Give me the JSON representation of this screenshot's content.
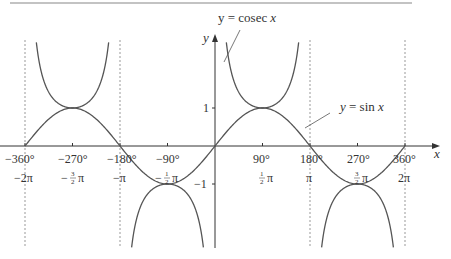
{
  "chart_data": {
    "type": "line",
    "title": "",
    "xlabel": "x",
    "ylabel": "y",
    "xlim_deg": [
      -360,
      360
    ],
    "ylim": [
      -2.7,
      2.8
    ],
    "grid": false,
    "series": [
      {
        "name": "y = sin x",
        "function": "sin",
        "color": "#555555"
      },
      {
        "name": "y = cosec x",
        "function": "cosec",
        "color": "#555555"
      }
    ],
    "asymptotes_deg": [
      -360,
      -180,
      180,
      360
    ],
    "x_ticks": [
      {
        "deg": -360,
        "deg_label": "−360°",
        "rad_label": "−2π"
      },
      {
        "deg": -270,
        "deg_label": "−270°",
        "rad_label": "−³⁄₂π"
      },
      {
        "deg": -180,
        "deg_label": "−180°",
        "rad_label": "−π"
      },
      {
        "deg": -90,
        "deg_label": "−90°",
        "rad_label": "−½π"
      },
      {
        "deg": 90,
        "deg_label": "90°",
        "rad_label": "½π"
      },
      {
        "deg": 180,
        "deg_label": "180°",
        "rad_label": "π"
      },
      {
        "deg": 270,
        "deg_label": "270°",
        "rad_label": "³⁄₂π"
      },
      {
        "deg": 360,
        "deg_label": "360°",
        "rad_label": "2π"
      }
    ],
    "y_ticks": [
      {
        "value": 1,
        "label": "1"
      },
      {
        "value": -1,
        "label": "−1"
      }
    ],
    "annotations": [
      {
        "text": "y = cosec x",
        "points_to": "cosec branch near x=10°"
      },
      {
        "text": "y = sin x",
        "points_to": "sin curve near x=160°"
      }
    ]
  },
  "labels": {
    "x_axis": "x",
    "y_axis": "y",
    "cosec_eq": "y = cosec",
    "cosec_var": "x",
    "sin_eq": "y = sin",
    "sin_var": "x",
    "tick_360n": "−360°",
    "tick_270n": "−270°",
    "tick_180n": "−180°",
    "tick_90n": "−90°",
    "tick_90": "90°",
    "tick_180": "180°",
    "tick_270": "270°",
    "tick_360": "360°",
    "rad_2pin": "−2π",
    "rad_pin": "−π",
    "rad_pi": "π",
    "rad_2pi": "2π",
    "rad_neg": "−",
    "pi": "π",
    "y_one": "1",
    "y_neg_one": "−1"
  }
}
